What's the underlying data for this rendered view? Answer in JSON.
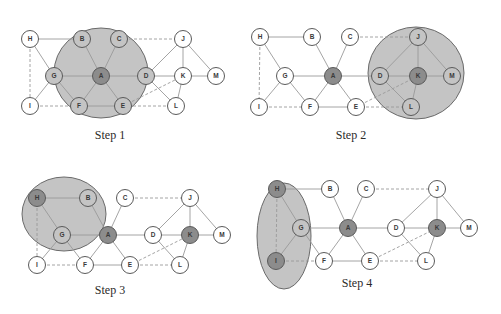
{
  "colors": {
    "background": "#ffffff",
    "node_fill": "#ffffff",
    "node_stroke": "#5a5a5a",
    "active_node_fill": "#8c8c8c",
    "region_fill": "#c4c4c4",
    "region_stroke": "#6a6a6a",
    "edge": "#9a9a9a",
    "label": "#3a3a3a"
  },
  "graph": {
    "nodes": [
      "A",
      "B",
      "C",
      "D",
      "E",
      "F",
      "G",
      "H",
      "I",
      "J",
      "K",
      "L",
      "M"
    ],
    "edges": [
      {
        "from": "H",
        "to": "B",
        "style": "solid"
      },
      {
        "from": "H",
        "to": "G",
        "style": "solid"
      },
      {
        "from": "H",
        "to": "I",
        "style": "dashed"
      },
      {
        "from": "G",
        "to": "I",
        "style": "solid"
      },
      {
        "from": "G",
        "to": "A",
        "style": "solid"
      },
      {
        "from": "G",
        "to": "F",
        "style": "solid"
      },
      {
        "from": "B",
        "to": "A",
        "style": "solid"
      },
      {
        "from": "C",
        "to": "A",
        "style": "solid"
      },
      {
        "from": "C",
        "to": "J",
        "style": "dashed"
      },
      {
        "from": "A",
        "to": "D",
        "style": "solid"
      },
      {
        "from": "A",
        "to": "F",
        "style": "solid"
      },
      {
        "from": "A",
        "to": "E",
        "style": "solid"
      },
      {
        "from": "I",
        "to": "F",
        "style": "dashed"
      },
      {
        "from": "F",
        "to": "E",
        "style": "solid"
      },
      {
        "from": "E",
        "to": "L",
        "style": "dashed"
      },
      {
        "from": "E",
        "to": "K",
        "style": "dashed"
      },
      {
        "from": "D",
        "to": "J",
        "style": "solid"
      },
      {
        "from": "D",
        "to": "K",
        "style": "solid"
      },
      {
        "from": "D",
        "to": "L",
        "style": "solid"
      },
      {
        "from": "J",
        "to": "K",
        "style": "solid"
      },
      {
        "from": "J",
        "to": "M",
        "style": "solid"
      },
      {
        "from": "K",
        "to": "M",
        "style": "solid"
      },
      {
        "from": "K",
        "to": "L",
        "style": "solid"
      }
    ]
  },
  "panels": [
    {
      "caption": "Step 1",
      "caption_pos": [
        110,
        138
      ],
      "active": [
        "A"
      ],
      "region": {
        "type": "ellipse",
        "cx": 101,
        "cy": 73,
        "rx": 47,
        "ry": 45,
        "members": [
          "A",
          "B",
          "C",
          "D",
          "E",
          "F",
          "G"
        ]
      },
      "positions": {
        "H": [
          30,
          39
        ],
        "B": [
          82,
          39
        ],
        "C": [
          119,
          39
        ],
        "J": [
          183,
          39
        ],
        "G": [
          54,
          76
        ],
        "A": [
          101,
          76
        ],
        "D": [
          146,
          76
        ],
        "K": [
          183,
          76
        ],
        "M": [
          216,
          76
        ],
        "I": [
          30,
          106
        ],
        "F": [
          79,
          106
        ],
        "E": [
          123,
          106
        ],
        "L": [
          176,
          106
        ]
      }
    },
    {
      "caption": "Step 2",
      "caption_pos": [
        351,
        138
      ],
      "active": [
        "A",
        "K"
      ],
      "region": {
        "type": "ellipse",
        "cx": 416,
        "cy": 73,
        "rx": 48,
        "ry": 46,
        "members": [
          "J",
          "D",
          "K",
          "M",
          "L"
        ]
      },
      "positions": {
        "H": [
          260,
          37
        ],
        "B": [
          312,
          37
        ],
        "C": [
          350,
          37
        ],
        "J": [
          418,
          37
        ],
        "G": [
          285,
          76
        ],
        "A": [
          333,
          76
        ],
        "D": [
          380,
          76
        ],
        "K": [
          418,
          76
        ],
        "M": [
          452,
          76
        ],
        "I": [
          259,
          107
        ],
        "F": [
          310,
          107
        ],
        "E": [
          356,
          107
        ],
        "L": [
          411,
          107
        ]
      }
    },
    {
      "caption": "Step 3",
      "caption_pos": [
        110,
        293
      ],
      "active": [
        "H",
        "A",
        "K"
      ],
      "region": {
        "type": "ellipse",
        "cx": 64,
        "cy": 214,
        "rx": 42,
        "ry": 37,
        "members": [
          "H",
          "B",
          "G"
        ]
      },
      "positions": {
        "H": [
          37,
          198
        ],
        "B": [
          88,
          198
        ],
        "C": [
          125,
          198
        ],
        "J": [
          190,
          198
        ],
        "G": [
          62,
          235
        ],
        "A": [
          108,
          235
        ],
        "D": [
          153,
          235
        ],
        "K": [
          190,
          235
        ],
        "M": [
          222,
          235
        ],
        "I": [
          37,
          265
        ],
        "F": [
          85,
          265
        ],
        "E": [
          130,
          265
        ],
        "L": [
          180,
          265
        ]
      }
    },
    {
      "caption": "Step 4",
      "caption_pos": [
        357,
        286
      ],
      "active": [
        "H",
        "I",
        "A",
        "K"
      ],
      "region": {
        "type": "ellipse",
        "cx": 284,
        "cy": 236,
        "rx": 27,
        "ry": 53,
        "members": [
          "G",
          "I"
        ]
      },
      "positions": {
        "H": [
          277,
          189
        ],
        "B": [
          330,
          189
        ],
        "C": [
          366,
          189
        ],
        "J": [
          437,
          189
        ],
        "G": [
          301,
          228
        ],
        "A": [
          348,
          228
        ],
        "D": [
          396,
          228
        ],
        "K": [
          437,
          228
        ],
        "M": [
          469,
          228
        ],
        "I": [
          276,
          261
        ],
        "F": [
          324,
          261
        ],
        "E": [
          370,
          261
        ],
        "L": [
          426,
          261
        ]
      }
    }
  ]
}
